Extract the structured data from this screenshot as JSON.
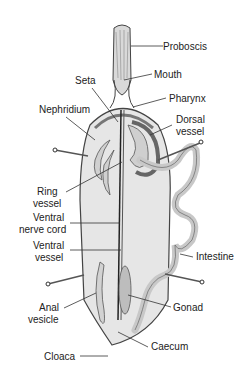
{
  "diagram": {
    "labels": {
      "proboscis": "Proboscis",
      "mouth": "Mouth",
      "seta": "Seta",
      "pharynx": "Pharynx",
      "nephridium": "Nephridium",
      "dorsal_vessel_1": "Dorsal",
      "dorsal_vessel_2": "vessel",
      "ring_vessel_1": "Ring",
      "ring_vessel_2": "vessel",
      "ventral_nerve_cord_1": "Ventral",
      "ventral_nerve_cord_2": "nerve cord",
      "ventral_vessel_1": "Ventral",
      "ventral_vessel_2": "vessel",
      "intestine": "Intestine",
      "anal_vesicle_1": "Anal",
      "anal_vesicle_2": "vesicle",
      "gonad": "Gonad",
      "caecum": "Caecum",
      "cloaca": "Cloaca"
    }
  }
}
